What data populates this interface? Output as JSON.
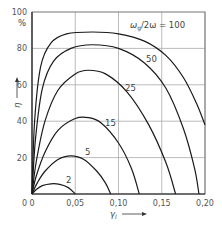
{
  "chart_data": {
    "type": "line",
    "title": "",
    "xlabel": "γ_l",
    "ylabel": "η",
    "y_unit": "%",
    "xlim": [
      0,
      0.2
    ],
    "ylim": [
      0,
      100
    ],
    "x_ticks": [
      "0",
      "0,05",
      "0,10",
      "0,15",
      "0,20"
    ],
    "x_tick_values": [
      0,
      0.05,
      0.1,
      0.15,
      0.2
    ],
    "y_ticks": [
      "0",
      "20",
      "40",
      "60",
      "80",
      "100"
    ],
    "y_tick_values": [
      0,
      20,
      40,
      60,
      80,
      100
    ],
    "grid": true,
    "legend_title": "ω_g/2ω =",
    "series": [
      {
        "name": "2",
        "label": "2",
        "x": [
          0,
          0.005,
          0.012,
          0.022,
          0.032,
          0.042,
          0.05
        ],
        "y": [
          0,
          2.5,
          4.6,
          5.6,
          5.3,
          3.5,
          0
        ]
      },
      {
        "name": "5",
        "label": "5",
        "x": [
          0,
          0.006,
          0.015,
          0.03,
          0.045,
          0.06,
          0.075,
          0.085,
          0.091
        ],
        "y": [
          0,
          6,
          12.5,
          19,
          21,
          19,
          12.5,
          6,
          0
        ]
      },
      {
        "name": "15",
        "label": "15",
        "x": [
          0,
          0.005,
          0.015,
          0.03,
          0.05,
          0.065,
          0.08,
          0.1,
          0.115,
          0.124
        ],
        "y": [
          0,
          10,
          23,
          35,
          41.5,
          42,
          39,
          28,
          14,
          0
        ]
      },
      {
        "name": "25",
        "label": "25",
        "x": [
          0,
          0.005,
          0.015,
          0.03,
          0.05,
          0.065,
          0.085,
          0.11,
          0.135,
          0.155,
          0.166
        ],
        "y": [
          0,
          18,
          40,
          57,
          66,
          68,
          66,
          56,
          38,
          17,
          0
        ]
      },
      {
        "name": "50",
        "label": "50",
        "x": [
          0,
          0.004,
          0.012,
          0.025,
          0.045,
          0.07,
          0.1,
          0.13,
          0.155,
          0.175,
          0.188,
          0.193
        ],
        "y": [
          0,
          30,
          58,
          73,
          80,
          82,
          80,
          72,
          58,
          36,
          14,
          0
        ]
      },
      {
        "name": "100",
        "label": "100",
        "x": [
          0,
          0.003,
          0.01,
          0.022,
          0.04,
          0.07,
          0.1,
          0.13,
          0.155,
          0.175,
          0.19,
          0.2
        ],
        "y": [
          0,
          40,
          70,
          83,
          88,
          89,
          88,
          84,
          76,
          64,
          50,
          38
        ]
      }
    ]
  },
  "labels": {
    "y_unit": "%",
    "y_axis": "η",
    "x_axis": "γ",
    "x_axis_sub": "l",
    "legend_prefix": "ω",
    "legend_sub": "g",
    "legend_rest": "/2ω = 100",
    "curve_50": "50",
    "curve_25": "25",
    "curve_15": "15",
    "curve_5": "5",
    "curve_2": "2"
  }
}
